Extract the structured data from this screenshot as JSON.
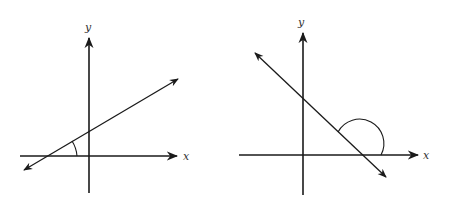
{
  "figures": [
    {
      "id": "left",
      "description": "Line with positive slope; angle of inclination is acute",
      "x_axis_label": "x",
      "y_axis_label": "y",
      "angle_type": "acute"
    },
    {
      "id": "right",
      "description": "Line with negative slope; angle of inclination is obtuse",
      "x_axis_label": "x",
      "y_axis_label": "y",
      "angle_type": "obtuse"
    }
  ],
  "colors": {
    "stroke": "#1a1a1a",
    "label": "#333333",
    "background": "#ffffff"
  }
}
